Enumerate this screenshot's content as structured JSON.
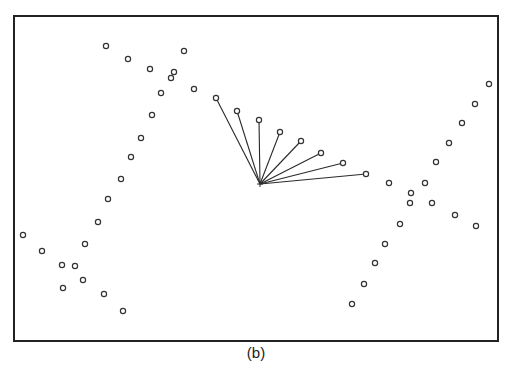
{
  "figure": {
    "caption": "(b)",
    "frame": {
      "x": 14,
      "y": 16,
      "width": 484,
      "height": 325,
      "stroke": "#222222"
    },
    "marker": {
      "shape": "open-circle",
      "radius": 2.6,
      "stroke": "#333333"
    },
    "line_color": "#2a2a2a"
  },
  "chart_data": {
    "type": "scatter",
    "title": "(b)",
    "xlabel": "",
    "ylabel": "",
    "grid": false,
    "legend": null,
    "note": "Pixel coordinates within 512x379 image; no axes/ticks shown. A fan of line segments connects a center point to nearby points.",
    "fan_center": {
      "x": 260,
      "y": 184
    },
    "fan_endpoints": [
      {
        "x": 216,
        "y": 98
      },
      {
        "x": 237,
        "y": 111
      },
      {
        "x": 259,
        "y": 120
      },
      {
        "x": 280,
        "y": 132
      },
      {
        "x": 301,
        "y": 141
      },
      {
        "x": 321,
        "y": 153
      },
      {
        "x": 343,
        "y": 163
      },
      {
        "x": 366,
        "y": 174
      }
    ],
    "series": [
      {
        "name": "left-cluster",
        "points": [
          {
            "x": 106,
            "y": 46
          },
          {
            "x": 128,
            "y": 59
          },
          {
            "x": 150,
            "y": 69
          },
          {
            "x": 184,
            "y": 51
          },
          {
            "x": 174,
            "y": 72
          },
          {
            "x": 171,
            "y": 78
          },
          {
            "x": 161,
            "y": 93
          },
          {
            "x": 194,
            "y": 89
          },
          {
            "x": 152,
            "y": 115
          },
          {
            "x": 141,
            "y": 138
          },
          {
            "x": 131,
            "y": 157
          },
          {
            "x": 121,
            "y": 179
          },
          {
            "x": 108,
            "y": 199
          },
          {
            "x": 98,
            "y": 222
          },
          {
            "x": 85,
            "y": 244
          },
          {
            "x": 23,
            "y": 235
          },
          {
            "x": 42,
            "y": 251
          },
          {
            "x": 62,
            "y": 265
          },
          {
            "x": 75,
            "y": 266
          },
          {
            "x": 83,
            "y": 280
          },
          {
            "x": 63,
            "y": 288
          },
          {
            "x": 104,
            "y": 294
          },
          {
            "x": 123,
            "y": 311
          }
        ]
      },
      {
        "name": "right-cluster",
        "points": [
          {
            "x": 489,
            "y": 84
          },
          {
            "x": 475,
            "y": 104
          },
          {
            "x": 462,
            "y": 123
          },
          {
            "x": 449,
            "y": 143
          },
          {
            "x": 436,
            "y": 162
          },
          {
            "x": 389,
            "y": 183
          },
          {
            "x": 425,
            "y": 183
          },
          {
            "x": 411,
            "y": 193
          },
          {
            "x": 410,
            "y": 203
          },
          {
            "x": 432,
            "y": 203
          },
          {
            "x": 455,
            "y": 215
          },
          {
            "x": 476,
            "y": 226
          },
          {
            "x": 400,
            "y": 224
          },
          {
            "x": 385,
            "y": 244
          },
          {
            "x": 375,
            "y": 263
          },
          {
            "x": 364,
            "y": 284
          },
          {
            "x": 352,
            "y": 304
          }
        ]
      }
    ]
  }
}
